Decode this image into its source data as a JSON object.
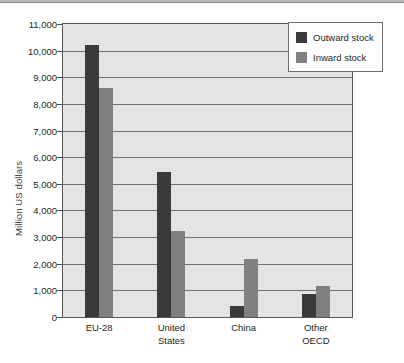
{
  "chart_data": {
    "type": "bar",
    "title": "",
    "subtitle": "",
    "xlabel": "",
    "ylabel": "Million US dollars",
    "categories": [
      "EU-28",
      "United States",
      "China",
      "Other OECD"
    ],
    "category_lines": [
      [
        "EU-28"
      ],
      [
        "United",
        "States"
      ],
      [
        "China"
      ],
      [
        "Other",
        "OECD"
      ]
    ],
    "series": [
      {
        "name": "Outward stock",
        "color": "#3a3a3a",
        "values": [
          10200,
          5450,
          430,
          870
        ]
      },
      {
        "name": "Inward stock",
        "color": "#808080",
        "values": [
          8600,
          3230,
          2180,
          1180
        ]
      }
    ],
    "ylim": [
      0,
      11000
    ],
    "ytick_step": 1000,
    "ytick_labels": [
      "11,000",
      "10,000",
      "9,000",
      "8,000",
      "7,000",
      "6,000",
      "5,000",
      "4,000",
      "3,000",
      "2,000",
      "1,000",
      "0"
    ],
    "ytick_values": [
      11000,
      10000,
      9000,
      8000,
      7000,
      6000,
      5000,
      4000,
      3000,
      2000,
      1000,
      0
    ],
    "grid": "horizontal",
    "legend_position": "top-right",
    "plot_background": "#e4e4e2"
  },
  "legend": {
    "items": [
      {
        "label": "Outward stock"
      },
      {
        "label": "Inward stock"
      }
    ]
  }
}
